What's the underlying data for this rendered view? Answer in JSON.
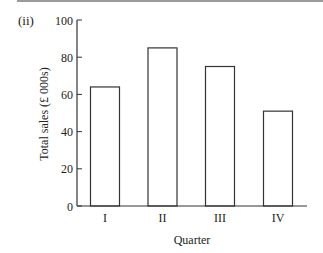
{
  "part_label": "(ii)",
  "colors": {
    "axis": "#333333",
    "bar_stroke": "#333333",
    "bar_fill": "#ffffff",
    "top_rule": "#9a9a9a"
  },
  "chart_data": {
    "type": "bar",
    "title": "",
    "categories": [
      "I",
      "II",
      "III",
      "IV"
    ],
    "values": [
      64,
      85,
      75,
      51
    ],
    "xlabel": "Quarter",
    "ylabel": "Total sales (£ 000s)",
    "ylim": [
      0,
      100
    ],
    "yticks": [
      0,
      20,
      40,
      60,
      80,
      100
    ],
    "grid": false,
    "legend": null
  }
}
